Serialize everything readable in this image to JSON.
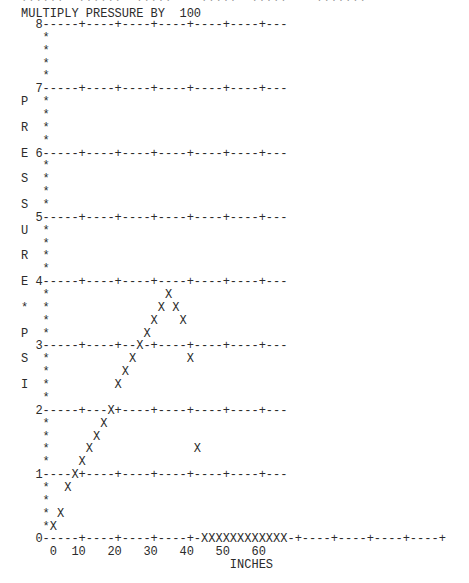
{
  "header": {
    "clipped_top_line": "??????  ??????  ?????    ?????  ?????    ???????",
    "multiplier_label": "MULTIPLY PRESSURE BY  100"
  },
  "plot_lines": [
    "  8-----+----+----+----+----+----+---",
    "   *",
    "   *",
    "   *",
    "   *",
    "  7-----+----+----+----+----+----+---",
    "P  *",
    "   *",
    "R  *",
    "   *",
    "E 6-----+----+----+----+----+----+---",
    "   *",
    "S  *",
    "   *",
    "S  *",
    "  5-----+----+----+----+----+----+---",
    "U  *",
    "   *",
    "R  *",
    "   *",
    "E 4-----+----+----+----+----+----+---",
    "   *                X",
    "*  *               X X",
    "   *              X   X",
    "P  *             X",
    "  3-----+----+--X-+----+----+----+---",
    "S  *           X       X",
    "   *          X",
    "I  *         X",
    "   *",
    "  2-----+---X+----+----+----+----+---",
    "   *       X",
    "   *      X",
    "   *     X              X",
    "   *    X",
    "  1----X+----+----+----+----+----+---",
    "   *  X",
    "   *",
    "   * X",
    "   *X",
    "  0-----+----+----+----+-XXXXXXXXXXXX-+----+----+----+----+",
    "    0  10   20   30   40   50   60",
    "                             INCHES"
  ],
  "chart_data": {
    "type": "scatter",
    "title": "MULTIPLY PRESSURE BY 100",
    "xlabel": "INCHES",
    "ylabel": "PRESSURE*PSI",
    "x_ticks": [
      "0",
      "10",
      "20",
      "30",
      "40",
      "50",
      "60"
    ],
    "y_ticks": [
      "0",
      "1",
      "2",
      "3",
      "4",
      "5",
      "6",
      "7",
      "8"
    ],
    "xlim": [
      0,
      110
    ],
    "ylim": [
      0,
      8
    ],
    "y_scale_multiplier": 100,
    "grid": true,
    "marker": "X",
    "points": [
      {
        "x": 2,
        "y": 0.2
      },
      {
        "x": 4,
        "y": 0.4
      },
      {
        "x": 6,
        "y": 0.8
      },
      {
        "x": 8,
        "y": 1.0
      },
      {
        "x": 10,
        "y": 1.2
      },
      {
        "x": 12,
        "y": 1.4
      },
      {
        "x": 14,
        "y": 1.6
      },
      {
        "x": 16,
        "y": 1.8
      },
      {
        "x": 18,
        "y": 2.0
      },
      {
        "x": 20,
        "y": 2.4
      },
      {
        "x": 22,
        "y": 2.6
      },
      {
        "x": 24,
        "y": 2.8
      },
      {
        "x": 26,
        "y": 3.0
      },
      {
        "x": 28,
        "y": 3.2
      },
      {
        "x": 30,
        "y": 3.4
      },
      {
        "x": 32,
        "y": 3.6
      },
      {
        "x": 34,
        "y": 3.8
      },
      {
        "x": 36,
        "y": 3.6
      },
      {
        "x": 38,
        "y": 3.4
      },
      {
        "x": 40,
        "y": 2.8
      },
      {
        "x": 42,
        "y": 1.4
      },
      {
        "x": 44,
        "y": 0
      },
      {
        "x": 46,
        "y": 0
      },
      {
        "x": 48,
        "y": 0
      },
      {
        "x": 50,
        "y": 0
      },
      {
        "x": 52,
        "y": 0
      },
      {
        "x": 54,
        "y": 0
      },
      {
        "x": 56,
        "y": 0
      },
      {
        "x": 58,
        "y": 0
      },
      {
        "x": 60,
        "y": 0
      },
      {
        "x": 62,
        "y": 0
      },
      {
        "x": 64,
        "y": 0
      },
      {
        "x": 66,
        "y": 0
      }
    ]
  }
}
